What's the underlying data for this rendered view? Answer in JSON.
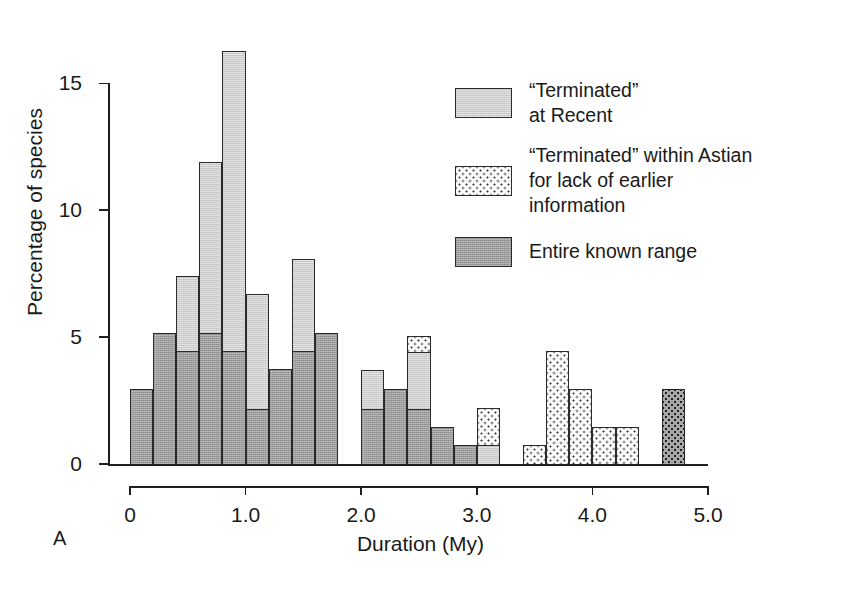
{
  "panel_label": "A",
  "chart_data": {
    "type": "bar",
    "title": "",
    "xlabel": "Duration (My)",
    "ylabel": "Percentage of species",
    "xlim": [
      0,
      5.0
    ],
    "ylim": [
      0,
      17.5
    ],
    "grid": false,
    "bin_width": 0.2,
    "x_tick_labels": [
      "0",
      "1.0",
      "2.0",
      "3.0",
      "4.0",
      "5.0"
    ],
    "x_ticks": [
      0,
      1.0,
      2.0,
      3.0,
      4.0,
      5.0
    ],
    "y_tick_labels": [
      "0",
      "5",
      "10",
      "15"
    ],
    "y_ticks": [
      0,
      5,
      10,
      15
    ],
    "legend_position": "upper-right",
    "stacked": true,
    "series": [
      {
        "name": "Entire known range",
        "key": "entire",
        "color": "#9d9d9d",
        "pattern": "solid-mid-grey",
        "values": [
          3.0,
          5.2,
          4.5,
          5.2,
          4.5,
          2.2,
          3.8,
          4.5,
          5.2,
          0,
          2.2,
          3.0,
          2.2,
          1.5,
          0.8,
          0,
          0,
          0,
          0,
          0,
          0,
          0,
          0,
          0
        ]
      },
      {
        "name": "“Terminated” at Recent",
        "key": "recent",
        "color": "#cfcfcf",
        "pattern": "light-grey",
        "values": [
          0,
          0,
          3.0,
          6.8,
          11.9,
          4.6,
          0,
          3.7,
          0,
          0,
          1.6,
          0,
          2.3,
          0,
          0,
          0.8,
          0,
          0,
          0,
          0,
          0,
          0,
          0,
          0
        ]
      },
      {
        "name": "“Terminated” within Astian for lack of earlier information",
        "key": "astian",
        "color": "#fbfbfb",
        "pattern": "white-stippled",
        "values": [
          0,
          0,
          0,
          0,
          0,
          0,
          0,
          0,
          0,
          0,
          0,
          0,
          0.7,
          0,
          0,
          1.5,
          2.2,
          0,
          0.8,
          4.5,
          3.0,
          1.5,
          1.5,
          0
        ]
      },
      {
        "name": "Entire known range (stippled, terminal bin)",
        "key": "astian_dark",
        "color": "#a8a8a8",
        "pattern": "dark-stippled",
        "values": [
          0,
          0,
          0,
          0,
          0,
          0,
          0,
          0,
          0,
          0,
          0,
          0,
          0,
          0,
          0,
          0,
          0,
          0,
          0,
          0,
          0,
          0,
          0,
          3.0
        ]
      }
    ],
    "bins": [
      {
        "x0": 0.0,
        "x1": 0.2,
        "entire": 3.0,
        "recent": 0,
        "astian": 0,
        "astian_dark": 0,
        "total": 3.0
      },
      {
        "x0": 0.2,
        "x1": 0.4,
        "entire": 5.2,
        "recent": 0,
        "astian": 0,
        "astian_dark": 0,
        "total": 5.2
      },
      {
        "x0": 0.4,
        "x1": 0.6,
        "entire": 4.5,
        "recent": 3.0,
        "astian": 0,
        "astian_dark": 0,
        "total": 7.5
      },
      {
        "x0": 0.6,
        "x1": 0.8,
        "entire": 5.2,
        "recent": 6.8,
        "astian": 0,
        "astian_dark": 0,
        "total": 12.0
      },
      {
        "x0": 0.8,
        "x1": 1.0,
        "entire": 4.5,
        "recent": 11.9,
        "astian": 0,
        "astian_dark": 0,
        "total": 16.4
      },
      {
        "x0": 1.0,
        "x1": 1.2,
        "entire": 2.2,
        "recent": 4.6,
        "astian": 0,
        "astian_dark": 0,
        "total": 6.8
      },
      {
        "x0": 1.2,
        "x1": 1.4,
        "entire": 3.8,
        "recent": 0,
        "astian": 0,
        "astian_dark": 0,
        "total": 3.8
      },
      {
        "x0": 1.4,
        "x1": 1.6,
        "entire": 4.5,
        "recent": 3.7,
        "astian": 0,
        "astian_dark": 0,
        "total": 8.2
      },
      {
        "x0": 1.6,
        "x1": 1.8,
        "entire": 5.2,
        "recent": 0,
        "astian": 0,
        "astian_dark": 0,
        "total": 5.2
      },
      {
        "x0": 1.8,
        "x1": 2.0,
        "entire": 0,
        "recent": 0,
        "astian": 0,
        "astian_dark": 0,
        "total": 0
      },
      {
        "x0": 2.0,
        "x1": 2.2,
        "entire": 2.2,
        "recent": 1.6,
        "astian": 0,
        "astian_dark": 0,
        "total": 3.8
      },
      {
        "x0": 2.2,
        "x1": 2.4,
        "entire": 3.0,
        "recent": 0,
        "astian": 0,
        "astian_dark": 0,
        "total": 3.0
      },
      {
        "x0": 2.4,
        "x1": 2.6,
        "entire": 2.2,
        "recent": 2.3,
        "astian": 0.7,
        "astian_dark": 0,
        "total": 5.2
      },
      {
        "x0": 2.6,
        "x1": 2.8,
        "entire": 1.5,
        "recent": 0,
        "astian": 0,
        "astian_dark": 0,
        "total": 1.5
      },
      {
        "x0": 2.8,
        "x1": 3.0,
        "entire": 0.8,
        "recent": 0,
        "astian": 0,
        "astian_dark": 0,
        "total": 0.8
      },
      {
        "x0": 3.0,
        "x1": 3.2,
        "entire": 0,
        "recent": 0.8,
        "astian": 1.5,
        "astian_dark": 0,
        "total": 2.2
      },
      {
        "x0": 3.2,
        "x1": 3.4,
        "entire": 0,
        "recent": 0,
        "astian": 0,
        "astian_dark": 0,
        "total": 0
      },
      {
        "x0": 3.4,
        "x1": 3.6,
        "entire": 0,
        "recent": 0,
        "astian": 0.8,
        "astian_dark": 0,
        "total": 0.8
      },
      {
        "x0": 3.6,
        "x1": 3.8,
        "entire": 0,
        "recent": 0,
        "astian": 4.5,
        "astian_dark": 0,
        "total": 4.5
      },
      {
        "x0": 3.8,
        "x1": 4.0,
        "entire": 0,
        "recent": 0,
        "astian": 3.0,
        "astian_dark": 0,
        "total": 3.0
      },
      {
        "x0": 4.0,
        "x1": 4.2,
        "entire": 0,
        "recent": 0,
        "astian": 1.5,
        "astian_dark": 0,
        "total": 1.5
      },
      {
        "x0": 4.2,
        "x1": 4.4,
        "entire": 0,
        "recent": 0,
        "astian": 1.5,
        "astian_dark": 0,
        "total": 1.5
      },
      {
        "x0": 4.4,
        "x1": 4.6,
        "entire": 0,
        "recent": 0,
        "astian": 0,
        "astian_dark": 0,
        "total": 0
      },
      {
        "x0": 4.6,
        "x1": 4.8,
        "entire": 0,
        "recent": 0,
        "astian": 0,
        "astian_dark": 3.0,
        "total": 3.0
      }
    ],
    "legend": [
      {
        "key": "recent",
        "label": "“Terminated”\nat Recent"
      },
      {
        "key": "astian",
        "label": "“Terminated” within Astian\nfor lack of earlier\ninformation"
      },
      {
        "key": "entire",
        "label": "Entire known range"
      }
    ]
  }
}
